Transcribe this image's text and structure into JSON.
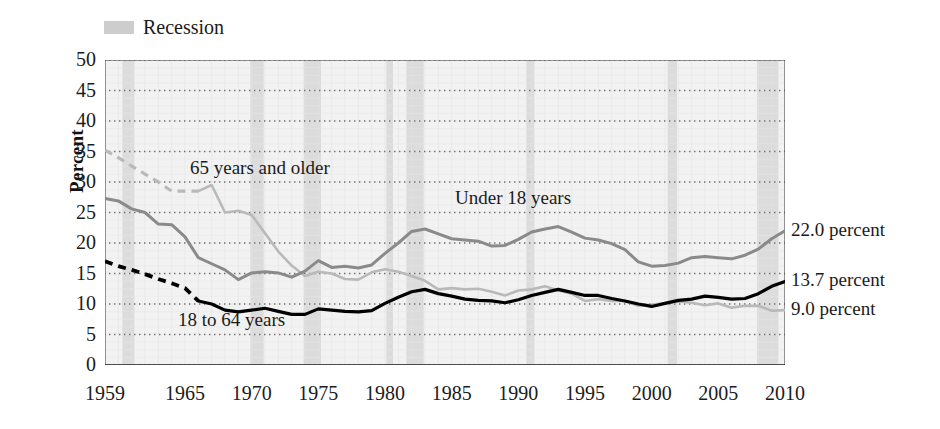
{
  "legend": {
    "recession_label": "Recession",
    "recession_color": "#cdcdcd"
  },
  "axes": {
    "ylabel": "Percent",
    "yticks": [
      "50",
      "45",
      "40",
      "35",
      "30",
      "25",
      "20",
      "15",
      "10",
      "5",
      "0"
    ],
    "xticks": [
      "1959",
      "1965",
      "1970",
      "1975",
      "1980",
      "1985",
      "1990",
      "1995",
      "2000",
      "2005",
      "2010"
    ]
  },
  "series_labels": {
    "older": "65 years and older",
    "under18": "Under 18 years",
    "adults": "18 to 64 years"
  },
  "end_labels": {
    "under18": "22.0 percent",
    "adults": "13.7 percent",
    "older": "9.0 percent"
  },
  "chart_data": {
    "type": "line",
    "title": "",
    "xlabel": "",
    "ylabel": "Percent",
    "xlim": [
      1959,
      2010
    ],
    "ylim": [
      0,
      50
    ],
    "ytick_step": 5,
    "grid": "horizontal-dotted",
    "legend_position": "top-left",
    "colors": {
      "under18": "#8a8a8a",
      "adults": "#000000",
      "older": "#b9b9b9",
      "recession_band": "#dcdcdc",
      "gridline": "#6f6f6f"
    },
    "x": [
      1959,
      1960,
      1961,
      1962,
      1963,
      1964,
      1965,
      1966,
      1967,
      1968,
      1969,
      1970,
      1971,
      1972,
      1973,
      1974,
      1975,
      1976,
      1977,
      1978,
      1979,
      1980,
      1981,
      1982,
      1983,
      1984,
      1985,
      1986,
      1987,
      1988,
      1989,
      1990,
      1991,
      1992,
      1993,
      1994,
      1995,
      1996,
      1997,
      1998,
      1999,
      2000,
      2001,
      2002,
      2003,
      2004,
      2005,
      2006,
      2007,
      2008,
      2009,
      2010
    ],
    "series": [
      {
        "name": "Under 18 years",
        "color": "#8a8a8a",
        "style": "solid",
        "values": [
          27.3,
          26.9,
          25.6,
          25.0,
          23.1,
          23.0,
          21.0,
          17.6,
          16.6,
          15.6,
          14.0,
          15.1,
          15.3,
          15.1,
          14.4,
          15.4,
          17.1,
          16.0,
          16.2,
          15.9,
          16.4,
          18.3,
          20.0,
          21.9,
          22.3,
          21.5,
          20.7,
          20.5,
          20.3,
          19.5,
          19.6,
          20.6,
          21.8,
          22.3,
          22.7,
          21.8,
          20.8,
          20.5,
          19.9,
          18.9,
          16.9,
          16.2,
          16.3,
          16.7,
          17.6,
          17.8,
          17.6,
          17.4,
          18.0,
          19.0,
          20.7,
          22.0
        ]
      },
      {
        "name": "18 to 64 years",
        "color": "#000000",
        "style": "dashed-then-solid",
        "solid_from": 1966,
        "values": [
          17.0,
          16.2,
          15.6,
          14.9,
          14.1,
          13.4,
          12.6,
          10.5,
          10.0,
          9.0,
          8.7,
          9.0,
          9.3,
          8.8,
          8.3,
          8.3,
          9.2,
          9.0,
          8.8,
          8.7,
          8.9,
          10.1,
          11.1,
          12.0,
          12.4,
          11.7,
          11.3,
          10.8,
          10.6,
          10.5,
          10.2,
          10.7,
          11.4,
          11.9,
          12.4,
          11.9,
          11.4,
          11.4,
          10.9,
          10.5,
          10.0,
          9.6,
          10.1,
          10.6,
          10.8,
          11.3,
          11.1,
          10.8,
          10.9,
          11.7,
          12.9,
          13.7
        ]
      },
      {
        "name": "65 years and older",
        "color": "#b9b9b9",
        "style": "dashed-then-solid",
        "solid_from": 1966,
        "values": [
          35.2,
          34.0,
          32.6,
          31.3,
          30.0,
          28.5,
          28.5,
          28.5,
          29.5,
          25.0,
          25.3,
          24.6,
          21.6,
          18.6,
          16.3,
          14.6,
          15.3,
          15.0,
          14.1,
          14.0,
          15.2,
          15.7,
          15.3,
          14.6,
          13.8,
          12.4,
          12.6,
          12.4,
          12.5,
          12.0,
          11.4,
          12.2,
          12.4,
          12.9,
          12.2,
          11.7,
          10.5,
          10.8,
          10.5,
          10.5,
          9.7,
          9.9,
          10.1,
          10.4,
          10.2,
          9.8,
          10.1,
          9.4,
          9.7,
          9.7,
          8.9,
          9.0
        ]
      }
    ],
    "recession_bands": [
      [
        1960.3,
        1961.2
      ],
      [
        1969.9,
        1970.9
      ],
      [
        1973.9,
        1975.2
      ],
      [
        1980.1,
        1980.6
      ],
      [
        1981.6,
        1982.9
      ],
      [
        1990.6,
        1991.2
      ],
      [
        2001.2,
        2001.9
      ],
      [
        2007.9,
        2009.5
      ]
    ]
  }
}
